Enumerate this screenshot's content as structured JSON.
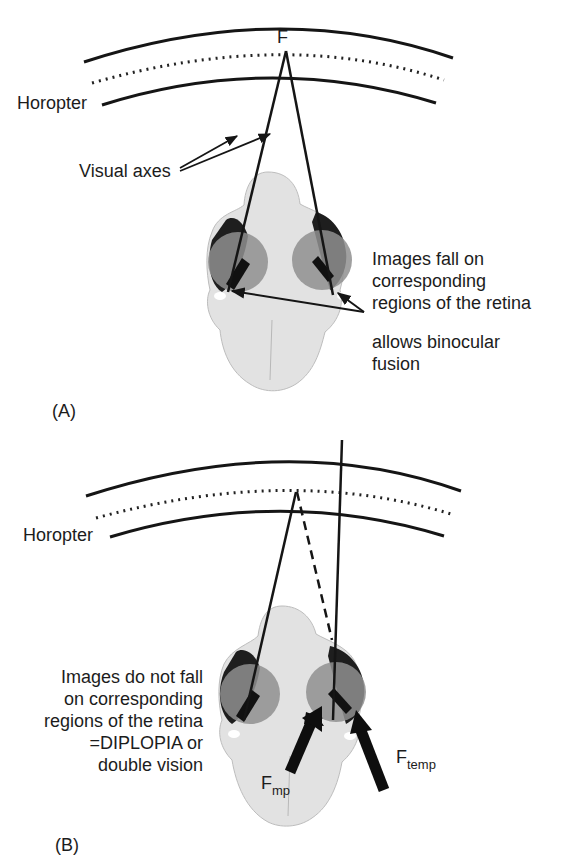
{
  "panel_a": {
    "panel_label": "(A)",
    "fixation_label": "F",
    "horopter_label": "Horopter",
    "visual_axes_label": "Visual axes",
    "retina_note_lines": [
      "Images fall on",
      "corresponding",
      "regions of the retina"
    ],
    "fusion_note_lines": [
      "allows binocular",
      "fusion"
    ]
  },
  "panel_b": {
    "panel_label": "(B)",
    "horopter_label": "Horopter",
    "diplopia_note_lines": [
      "Images do not fall",
      "on corresponding",
      "regions of the retina",
      "=DIPLOPIA or",
      "double vision"
    ],
    "arrow_left_label": {
      "main": "F",
      "sub": "mp"
    },
    "arrow_right_label": {
      "main": "F",
      "sub": "temp"
    }
  },
  "colors": {
    "line": "#151515",
    "skull": "#e4e4e4",
    "skull_shade": "#c9c9c9",
    "eye_dark": "#1e1e1e",
    "eye_grey": "#8f8f8f"
  }
}
